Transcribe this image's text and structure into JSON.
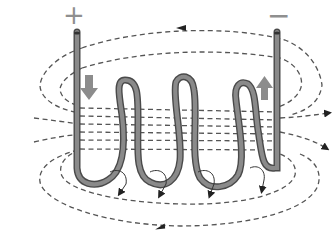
{
  "diagram": {
    "terminals": {
      "positive_label": "+",
      "negative_label": "−"
    },
    "coil_turns": 3,
    "current_arrows": [
      {
        "id": "current-in",
        "direction": "down",
        "side": "left"
      },
      {
        "id": "current-out",
        "direction": "up",
        "side": "right"
      }
    ],
    "colors": {
      "wire": "#8a8a8a",
      "wire_edge": "#4a4a4a",
      "field_line": "#555555",
      "current_arrow": "#8c8c8c",
      "terminal_label": "#8f8f8f"
    }
  }
}
